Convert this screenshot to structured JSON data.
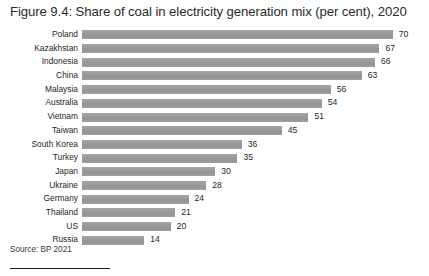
{
  "figure": {
    "title": "Figure 9.4: Share of coal in electricity generation mix (per cent), 2020",
    "source": "Source: BP 2021"
  },
  "chart_data": {
    "type": "bar",
    "orientation": "horizontal",
    "title": "Figure 9.4: Share of coal in electricity generation mix (per cent), 2020",
    "xlabel": "",
    "ylabel": "",
    "unit": "per cent",
    "year": "2020",
    "grid": false,
    "legend": false,
    "xlim": [
      0,
      70
    ],
    "bar_color": "#9b9b9b",
    "categories": [
      "Poland",
      "Kazakhstan",
      "Indonesia",
      "China",
      "Malaysia",
      "Australia",
      "Vietnam",
      "Taiwan",
      "South Korea",
      "Turkey",
      "Japan",
      "Ukraine",
      "Germany",
      "Thailand",
      "US",
      "Russia"
    ],
    "values": [
      70,
      67,
      66,
      63,
      56,
      54,
      51,
      45,
      36,
      35,
      30,
      28,
      24,
      21,
      20,
      14
    ],
    "value_labels": [
      "70",
      "67",
      "66",
      "63",
      "56",
      "54",
      "51",
      "45",
      "36",
      "35",
      "30",
      "28",
      "24",
      "21",
      "20",
      "14"
    ]
  }
}
